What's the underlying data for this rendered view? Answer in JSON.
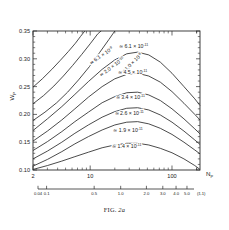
{
  "figure": {
    "caption_label": "FIG.",
    "caption_number": "2a",
    "caption_body": ""
  },
  "chart_data": {
    "type": "line",
    "title": "",
    "xlabel": "N_P",
    "ylabel": "W_P",
    "x_axis": {
      "scale": "log",
      "min": 2,
      "max": 220,
      "tick_labels": [
        "2",
        "10",
        "100"
      ],
      "tick_values": [
        2,
        10,
        100
      ],
      "title": "N",
      "title_sub": "P"
    },
    "y_axis": {
      "scale": "linear",
      "min": 0.1,
      "max": 0.35,
      "tick_labels": [
        "0.10",
        "0.15",
        "0.20",
        "0.25",
        "0.30",
        "0.35"
      ],
      "tick_values": [
        0.1,
        0.15,
        0.2,
        0.25,
        0.3,
        0.35
      ],
      "title": "W",
      "title_sub": "P"
    },
    "secondary_x_axis": {
      "label": "(ξ-1)",
      "tick_labels": [
        "0.04",
        "0.1",
        "0.5",
        "1.0",
        "2.0",
        "3.0",
        "4.0",
        "5.0"
      ],
      "tick_values": [
        0.04,
        0.1,
        0.5,
        1.0,
        2.0,
        3.0,
        4.0,
        5.0
      ]
    },
    "grid": false,
    "legend_position": "inline-curve-labels",
    "series": [
      {
        "name": "curve-6.1e-9",
        "label_prefix": "≃ 6.1 × 10",
        "label_exponent": "-9",
        "mantissa": 6.1,
        "exponent": -9,
        "label_x": 14,
        "label_y": 0.303,
        "label_rotation": -34,
        "points": [
          [
            2,
            0.249
          ],
          [
            2.6,
            0.264
          ],
          [
            3.4,
            0.281
          ],
          [
            4.3,
            0.297
          ],
          [
            5.4,
            0.313
          ],
          [
            6.6,
            0.328
          ],
          [
            7.6,
            0.34
          ],
          [
            8.6,
            0.35
          ]
        ]
      },
      {
        "name": "curve-2.0e-9",
        "label_prefix": "≃ 2.0 × 10",
        "label_exponent": "-10",
        "mantissa": 2.0,
        "exponent": -10,
        "label_x": 19,
        "label_y": 0.283,
        "label_rotation": -37,
        "points": [
          [
            2,
            0.219
          ],
          [
            2.7,
            0.234
          ],
          [
            3.6,
            0.251
          ],
          [
            4.7,
            0.269
          ],
          [
            6.1,
            0.288
          ],
          [
            7.9,
            0.308
          ],
          [
            10,
            0.327
          ],
          [
            12.4,
            0.345
          ],
          [
            13.6,
            0.35
          ]
        ]
      },
      {
        "name": "curve-1.0e-8",
        "label_prefix": "≃ 1.0 × 10",
        "label_exponent": "-8",
        "mantissa": 1.0,
        "exponent": -8,
        "label_x": 33,
        "label_y": 0.289,
        "label_rotation": -44,
        "points": [
          [
            2,
            0.189
          ],
          [
            2.8,
            0.204
          ],
          [
            3.9,
            0.221
          ],
          [
            5.3,
            0.24
          ],
          [
            7.2,
            0.262
          ],
          [
            9.8,
            0.286
          ],
          [
            13,
            0.311
          ],
          [
            17,
            0.335
          ],
          [
            20,
            0.35
          ]
        ]
      },
      {
        "name": "curve-6.1e-11",
        "label_prefix": "≃ 6.1 × 10",
        "label_exponent": "-11",
        "mantissa": 6.1,
        "exponent": -11,
        "label_x": 34,
        "label_y": 0.32,
        "label_rotation": 0,
        "points": [
          [
            2,
            0.171
          ],
          [
            3,
            0.192
          ],
          [
            4.5,
            0.214
          ],
          [
            6.5,
            0.236
          ],
          [
            9.5,
            0.259
          ],
          [
            14,
            0.281
          ],
          [
            20,
            0.298
          ],
          [
            28,
            0.309
          ],
          [
            38,
            0.312
          ],
          [
            52,
            0.307
          ],
          [
            72,
            0.294
          ],
          [
            100,
            0.274
          ],
          [
            140,
            0.25
          ],
          [
            190,
            0.228
          ],
          [
            220,
            0.216
          ]
        ]
      },
      {
        "name": "curve-4.5e-11",
        "label_prefix": "≃ 4.5 × 10",
        "label_exponent": "-11",
        "mantissa": 4.5,
        "exponent": -11,
        "label_x": 33,
        "label_y": 0.272,
        "label_rotation": 0,
        "points": [
          [
            2,
            0.152
          ],
          [
            3,
            0.17
          ],
          [
            4.5,
            0.19
          ],
          [
            6.5,
            0.21
          ],
          [
            9.5,
            0.231
          ],
          [
            14,
            0.25
          ],
          [
            20,
            0.264
          ],
          [
            28,
            0.272
          ],
          [
            38,
            0.274
          ],
          [
            52,
            0.269
          ],
          [
            72,
            0.258
          ],
          [
            100,
            0.241
          ],
          [
            140,
            0.22
          ],
          [
            190,
            0.2
          ],
          [
            220,
            0.19
          ]
        ]
      },
      {
        "name": "curve-3.4e-11",
        "label_prefix": "≃ 3.4 × 10",
        "label_exponent": "-11",
        "mantissa": 3.4,
        "exponent": -11,
        "label_x": 31,
        "label_y": 0.228,
        "label_rotation": 0,
        "points": [
          [
            2,
            0.135
          ],
          [
            3,
            0.151
          ],
          [
            4.5,
            0.169
          ],
          [
            6.5,
            0.187
          ],
          [
            9.5,
            0.204
          ],
          [
            14,
            0.221
          ],
          [
            20,
            0.232
          ],
          [
            28,
            0.239
          ],
          [
            38,
            0.24
          ],
          [
            52,
            0.235
          ],
          [
            72,
            0.225
          ],
          [
            100,
            0.21
          ],
          [
            140,
            0.192
          ],
          [
            190,
            0.174
          ],
          [
            220,
            0.165
          ]
        ]
      },
      {
        "name": "curve-2.6e-11",
        "label_prefix": "≃ 2.6 × 10",
        "label_exponent": "-11",
        "mantissa": 2.6,
        "exponent": -11,
        "label_x": 30,
        "label_y": 0.199,
        "label_rotation": 0,
        "points": [
          [
            2,
            0.12
          ],
          [
            3,
            0.134
          ],
          [
            4.5,
            0.15
          ],
          [
            6.5,
            0.166
          ],
          [
            9.5,
            0.181
          ],
          [
            14,
            0.195
          ],
          [
            20,
            0.205
          ],
          [
            28,
            0.211
          ],
          [
            38,
            0.212
          ],
          [
            52,
            0.208
          ],
          [
            72,
            0.199
          ],
          [
            100,
            0.186
          ],
          [
            140,
            0.17
          ],
          [
            190,
            0.154
          ],
          [
            220,
            0.146
          ]
        ]
      },
      {
        "name": "curve-1.9e-11",
        "label_prefix": "≃ 1.9 × 10",
        "label_exponent": "-11",
        "mantissa": 1.9,
        "exponent": -11,
        "label_x": 29,
        "label_y": 0.168,
        "label_rotation": 0,
        "points": [
          [
            2,
            0.107
          ],
          [
            3,
            0.119
          ],
          [
            4.5,
            0.133
          ],
          [
            6.5,
            0.147
          ],
          [
            9.5,
            0.16
          ],
          [
            14,
            0.172
          ],
          [
            20,
            0.181
          ],
          [
            28,
            0.186
          ],
          [
            38,
            0.187
          ],
          [
            52,
            0.183
          ],
          [
            72,
            0.175
          ],
          [
            100,
            0.164
          ],
          [
            140,
            0.15
          ],
          [
            190,
            0.136
          ],
          [
            220,
            0.129
          ]
        ]
      },
      {
        "name": "curve-1.4e-11",
        "label_prefix": "≃ 1.4 × 10",
        "label_exponent": "-11",
        "mantissa": 1.4,
        "exponent": -11,
        "label_x": 28,
        "label_y": 0.139,
        "label_rotation": 0,
        "points": [
          [
            2,
            0.101
          ],
          [
            3,
            0.108
          ],
          [
            4.5,
            0.116
          ],
          [
            6.5,
            0.124
          ],
          [
            9.5,
            0.132
          ],
          [
            14,
            0.14
          ],
          [
            20,
            0.145
          ],
          [
            28,
            0.148
          ],
          [
            38,
            0.148
          ],
          [
            52,
            0.145
          ],
          [
            72,
            0.139
          ],
          [
            100,
            0.131
          ],
          [
            140,
            0.12
          ],
          [
            190,
            0.108
          ],
          [
            220,
            0.101
          ]
        ]
      }
    ]
  }
}
